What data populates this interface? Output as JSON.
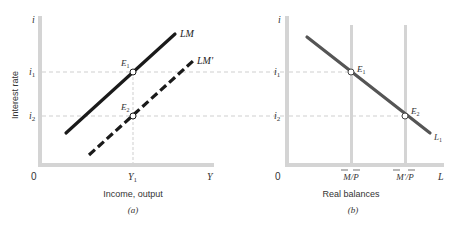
{
  "colors": {
    "axis": "#d4d4d4",
    "guide": "#cfcfcf",
    "lm_line": "#1a1a1a",
    "l1_line": "#555555",
    "text": "#333333",
    "point_fill": "#ffffff"
  },
  "panel_a": {
    "y_axis_label": "Interest rate",
    "y_axis_symbol": "i",
    "x_axis_label": "Income, output",
    "x_axis_symbol": "Y",
    "origin": "0",
    "caption": "(a)",
    "ticks_y": {
      "i1": "i",
      "i1_sub": "1",
      "i2": "i",
      "i2_sub": "2"
    },
    "ticks_x": {
      "y1": "Y",
      "y1_sub": "1"
    },
    "curves": [
      {
        "name": "LM",
        "label": "LM",
        "style": "solid"
      },
      {
        "name": "LM'",
        "label": "LM'",
        "style": "dashed"
      }
    ],
    "points": [
      {
        "name": "E1",
        "label": "E",
        "sub": "1"
      },
      {
        "name": "E2",
        "label": "E",
        "sub": "2"
      }
    ]
  },
  "panel_b": {
    "y_axis_symbol": "i",
    "x_axis_label": "Real balances",
    "x_axis_symbol": "L",
    "origin": "0",
    "caption": "(b)",
    "ticks_y": {
      "i1": "i",
      "i1_sub": "1",
      "i2": "i",
      "i2_sub": "2"
    },
    "ticks_x": {
      "mp": "M/P",
      "mp_prime": "M'/P"
    },
    "curves": [
      {
        "name": "L1",
        "label": "L",
        "sub": "1",
        "style": "solid"
      }
    ],
    "points": [
      {
        "name": "E1",
        "label": "E",
        "sub": "1"
      },
      {
        "name": "E2",
        "label": "E",
        "sub": "2"
      }
    ]
  }
}
